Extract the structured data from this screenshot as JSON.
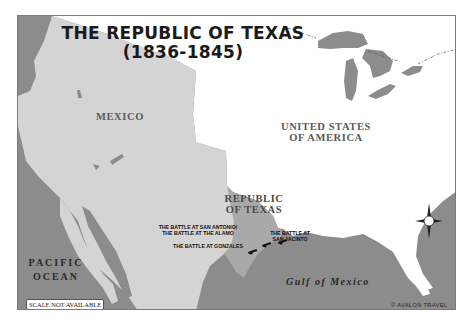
{
  "title": {
    "line1": "THE REPUBLIC OF TEXAS",
    "line2": "(1836-1845)"
  },
  "regions": {
    "mexico": "MEXICO",
    "usa_line1": "UNITED STATES",
    "usa_line2": "OF AMERICA",
    "texas_line1": "REPUBLIC",
    "texas_line2": "OF TEXAS"
  },
  "water": {
    "pacific_line1": "PACIFIC",
    "pacific_line2": "OCEAN",
    "gulf": "Gulf of Mexico"
  },
  "battles": [
    {
      "line1": "THE BATTLE AT SAN ANTONIO/",
      "line2": "THE BATTLE AT THE ALAMO",
      "icon": "cannon-icon"
    },
    {
      "line1": "THE BATTLE AT GONZALES",
      "icon": "cannon-icon"
    },
    {
      "line1": "THE BATTLE AT",
      "line2": "SAN JACINTO",
      "icon": "cannon-icon"
    }
  ],
  "footer": {
    "scale": "SCALE NOT AVAILABLE",
    "credit": "© AVALON TRAVEL"
  },
  "compass": {
    "icon": "compass-rose-icon"
  },
  "colors": {
    "water": "#8c8c8c",
    "mexico": "#d4d4d4",
    "texas": "#a9a9a9",
    "usa": "#ffffff",
    "lakes": "#8c8c8c"
  }
}
